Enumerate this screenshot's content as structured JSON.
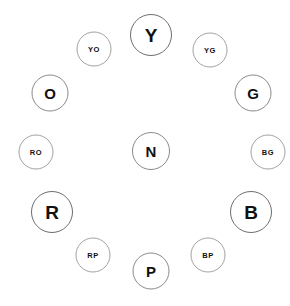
{
  "diagram": {
    "type": "color-wheel",
    "background_color": "#ffffff",
    "stroke_color": "#6e6e6e",
    "text_color": "#111111",
    "center": {
      "x": 151,
      "y": 151
    },
    "ring_radius": 118
  },
  "chart_data": {
    "type": "scatter",
    "xlabel": "",
    "ylabel": "",
    "layout": "radial-clock-face",
    "center": {
      "x": 151,
      "y": 151
    },
    "ring_radius": 118,
    "legend": "none",
    "grid": false,
    "categories": [
      "primary",
      "secondary",
      "tertiary",
      "neutral"
    ],
    "nodes": [
      {
        "label": "Y",
        "tier": "primary",
        "clock_position": 12,
        "angle_deg": 0,
        "x": 151,
        "y": 35,
        "diameter": 42
      },
      {
        "label": "YG",
        "tier": "tertiary",
        "clock_position": 1,
        "angle_deg": 30,
        "x": 210,
        "y": 50,
        "diameter": 35
      },
      {
        "label": "G",
        "tier": "secondary",
        "clock_position": 2,
        "angle_deg": 60,
        "x": 253,
        "y": 93,
        "diameter": 37
      },
      {
        "label": "BG",
        "tier": "tertiary",
        "clock_position": 3,
        "angle_deg": 90,
        "x": 268,
        "y": 152,
        "diameter": 35
      },
      {
        "label": "B",
        "tier": "primary",
        "clock_position": 4,
        "angle_deg": 120,
        "x": 251,
        "y": 212,
        "diameter": 42
      },
      {
        "label": "BP",
        "tier": "tertiary",
        "clock_position": 5,
        "angle_deg": 150,
        "x": 208,
        "y": 255,
        "diameter": 35
      },
      {
        "label": "P",
        "tier": "secondary",
        "clock_position": 6,
        "angle_deg": 180,
        "x": 151,
        "y": 271,
        "diameter": 37
      },
      {
        "label": "RP",
        "tier": "tertiary",
        "clock_position": 7,
        "angle_deg": 210,
        "x": 93,
        "y": 255,
        "diameter": 35
      },
      {
        "label": "R",
        "tier": "primary",
        "clock_position": 8,
        "angle_deg": 240,
        "x": 52,
        "y": 212,
        "diameter": 42
      },
      {
        "label": "RO",
        "tier": "tertiary",
        "clock_position": 9,
        "angle_deg": 270,
        "x": 36,
        "y": 152,
        "diameter": 35
      },
      {
        "label": "O",
        "tier": "secondary",
        "clock_position": 10,
        "angle_deg": 300,
        "x": 50,
        "y": 93,
        "diameter": 37
      },
      {
        "label": "YO",
        "tier": "tertiary",
        "clock_position": 11,
        "angle_deg": 330,
        "x": 94,
        "y": 49,
        "diameter": 35
      },
      {
        "label": "N",
        "tier": "neutral",
        "clock_position": 0,
        "angle_deg": 0,
        "x": 151,
        "y": 151,
        "diameter": 38
      }
    ]
  }
}
